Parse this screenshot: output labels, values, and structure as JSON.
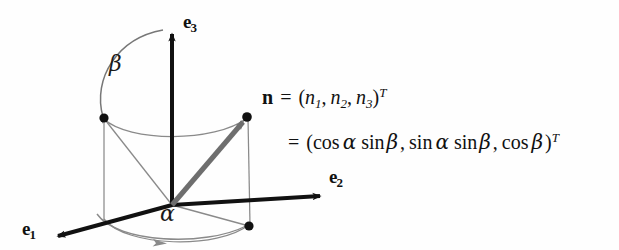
{
  "figure": {
    "kind": "spherical-coordinates-unit-vector-diagram",
    "background_color": "#fefefe",
    "ink_color": "#111111",
    "vector_color": "#6e6e6e",
    "thin_line_color": "#8a8a8a",
    "axes": [
      {
        "id": "e1",
        "label_base": "e",
        "label_sub": "1",
        "direction": "down-left"
      },
      {
        "id": "e2",
        "label_base": "e",
        "label_sub": "2",
        "direction": "down-right"
      },
      {
        "id": "e3",
        "label_base": "e",
        "label_sub": "3",
        "direction": "up"
      }
    ],
    "angles": [
      {
        "id": "alpha",
        "symbol": "α",
        "description": "azimuth angle in e1-e2 plane"
      },
      {
        "id": "beta",
        "symbol": "β",
        "description": "polar angle from e3 axis"
      }
    ],
    "points": [
      {
        "id": "origin",
        "label": ""
      },
      {
        "id": "n-tip",
        "label": "n"
      },
      {
        "id": "projection-e1-plane",
        "label": ""
      },
      {
        "id": "projection-ground",
        "label": ""
      }
    ],
    "equation": {
      "line1": {
        "lhs_vector": "n",
        "equals": "=",
        "open_paren": "(",
        "components": [
          "n",
          "n",
          "n"
        ],
        "component_subscripts": [
          "1",
          "2",
          "3"
        ],
        "separators": [
          ",",
          ","
        ],
        "close_paren": ")",
        "superscript": "T",
        "plain_text": "n = (n₁, n₂, n₃)ᵀ"
      },
      "line2": {
        "equals": "=",
        "open_paren": "(",
        "terms": [
          {
            "fn1": "cos",
            "arg1": "α",
            "fn2": "sin",
            "arg2": "β"
          },
          {
            "fn1": "sin",
            "arg1": "α",
            "fn2": "sin",
            "arg2": "β"
          },
          {
            "fn1": "cos",
            "arg1": "β",
            "fn2": "",
            "arg2": ""
          }
        ],
        "separators": [
          ",",
          ","
        ],
        "close_paren": ")",
        "superscript": "T",
        "plain_text": "= (cos α sin β, sin α sin β, cos β)ᵀ"
      }
    }
  }
}
